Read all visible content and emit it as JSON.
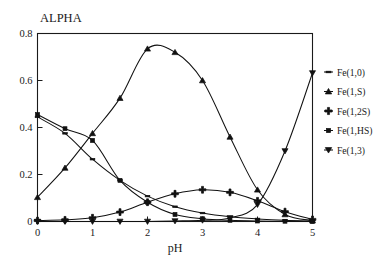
{
  "chart_data": {
    "type": "line",
    "title": "ALPHA",
    "xlabel": "pH",
    "ylabel": "",
    "xlim": [
      0,
      5
    ],
    "ylim": [
      0,
      0.8
    ],
    "xticks": [
      0,
      1,
      2,
      3,
      4,
      5
    ],
    "xticklabels": [
      "0",
      "1",
      "2",
      "3",
      "4",
      "5"
    ],
    "yticks": [
      0,
      0.2,
      0.4,
      0.6,
      0.8
    ],
    "yticklabels": [
      "0",
      "0.2",
      "0.4",
      "0.6",
      "0.8"
    ],
    "grid": false,
    "legend_position": "right-outside",
    "x": [
      0,
      0.5,
      1,
      1.5,
      2,
      2.5,
      3,
      3.5,
      4,
      4.5,
      5
    ],
    "series": [
      {
        "name": "Fe(1,0)",
        "marker": "dash",
        "values": [
          0.445,
          0.375,
          0.265,
          0.175,
          0.108,
          0.063,
          0.036,
          0.02,
          0.011,
          0.005,
          0.002
        ]
      },
      {
        "name": "Fe(1,S)",
        "marker": "triangle-up",
        "values": [
          0.103,
          0.228,
          0.375,
          0.525,
          0.735,
          0.72,
          0.6,
          0.36,
          0.135,
          0.03,
          0.004
        ]
      },
      {
        "name": "Fe(1,2S)",
        "marker": "plus",
        "values": [
          0.004,
          0.007,
          0.016,
          0.04,
          0.082,
          0.118,
          0.135,
          0.124,
          0.088,
          0.042,
          0.009
        ]
      },
      {
        "name": "Fe(1,HS)",
        "marker": "square",
        "values": [
          0.455,
          0.395,
          0.345,
          0.175,
          0.082,
          0.03,
          0.012,
          0.005,
          0.002,
          0.001,
          0.0
        ]
      },
      {
        "name": "Fe(1,3)",
        "marker": "triangle-down",
        "values": [
          0.0,
          0.0,
          0.0,
          0.0,
          0.0,
          0.002,
          0.005,
          0.015,
          0.072,
          0.3,
          0.632
        ]
      }
    ]
  },
  "colors": {
    "ink": "#111111",
    "frame": "#1a1a1a",
    "background": "#ffffff"
  }
}
